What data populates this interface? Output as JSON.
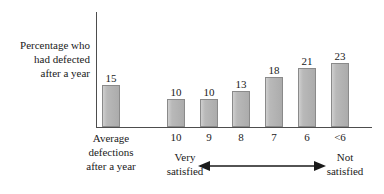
{
  "chart_data": {
    "type": "bar",
    "title": "",
    "subtitle": "",
    "ylabel": "Percentage who had defected after a year",
    "ylabel_lines": [
      "Percentage who",
      "had defected",
      "after a year"
    ],
    "xlabel": "",
    "categories": [
      "Average defections after a year",
      "10",
      "9",
      "8",
      "7",
      "6",
      "<6"
    ],
    "values": [
      15,
      10,
      10,
      13,
      18,
      21,
      23
    ],
    "data_labels": [
      "15",
      "10",
      "10",
      "13",
      "18",
      "21",
      "23"
    ],
    "ylim": [
      0,
      41
    ],
    "grid": false,
    "legend": false,
    "bar_color": "#b5b5b5",
    "bar_border_color": "#8a8a8a",
    "axis_color": "#4d4d4d",
    "text_color": "#1a1a1a",
    "annotations": {
      "left_end_lines": [
        "Very",
        "satisfied"
      ],
      "right_end_lines": [
        "Not",
        "satisfied"
      ],
      "arrow": "double-headed-horizontal-arrow"
    }
  },
  "axis": {
    "tick_labels": [
      "10",
      "9",
      "8",
      "7",
      "6",
      "<6"
    ],
    "first_category_lines": [
      "Average",
      "defections",
      "after a year"
    ]
  },
  "bars": [
    {
      "label": "Average defections after a year",
      "value": 15,
      "display": "15"
    },
    {
      "label": "10",
      "value": 10,
      "display": "10"
    },
    {
      "label": "9",
      "value": 10,
      "display": "10"
    },
    {
      "label": "8",
      "value": 13,
      "display": "13"
    },
    {
      "label": "7",
      "value": 18,
      "display": "18"
    },
    {
      "label": "6",
      "value": 21,
      "display": "21"
    },
    {
      "label": "<6",
      "value": 23,
      "display": "23"
    }
  ],
  "scale": {
    "px_per_unit": 2.8,
    "baseline_y": 127
  }
}
